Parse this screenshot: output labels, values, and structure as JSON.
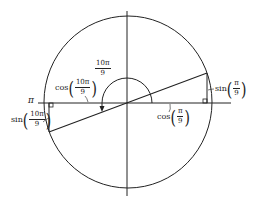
{
  "diagram": {
    "labels": {
      "pi": "π",
      "angle_num": "10π",
      "angle_den": "9",
      "cos10_fn": "cos",
      "cos10_num": "10π",
      "cos10_den": "9",
      "sin10_fn": "sin",
      "sin10_num": "10π",
      "sin10_den": "9",
      "cos1_fn": "cos",
      "cos1_num": "π",
      "cos1_den": "9",
      "sin1_fn": "sin",
      "sin1_num": "π",
      "sin1_den": "9",
      "lparen": "(",
      "rparen": ")"
    },
    "colors": {
      "stroke": "#222222",
      "background": "#ffffff"
    }
  }
}
